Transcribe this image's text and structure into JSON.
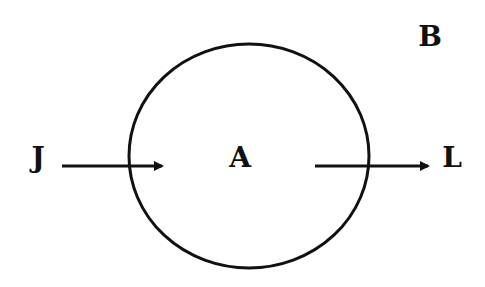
{
  "diagram": {
    "colors": {
      "stroke": "#111111",
      "background": "#ffffff"
    },
    "region": {
      "label": "A",
      "shape": "ellipse"
    },
    "outside_label": "B",
    "input": {
      "label": "J",
      "direction": "into-region"
    },
    "output": {
      "label": "L",
      "direction": "out-of-region"
    }
  }
}
